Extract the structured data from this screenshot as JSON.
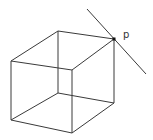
{
  "diagram": {
    "point_label": "p",
    "vertices": {
      "back_top_left": [
        58,
        31
      ],
      "back_top_right": [
        114,
        39
      ],
      "front_top_left": [
        11,
        61
      ],
      "front_top_right": [
        72,
        70
      ],
      "back_bottom_left": [
        58,
        93
      ],
      "back_bottom_right": [
        114,
        103
      ],
      "front_bottom_left": [
        11,
        120
      ],
      "front_bottom_right": [
        72,
        133
      ]
    },
    "line": {
      "start": [
        87,
        9
      ],
      "end": [
        146,
        74
      ]
    },
    "point": [
      114,
      39
    ],
    "colors": {
      "stroke": "#3a3a3a",
      "point": "#111111"
    }
  }
}
